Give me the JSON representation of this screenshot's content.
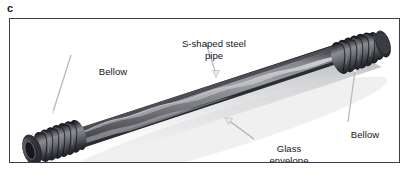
{
  "figure": {
    "panel_letter": "c",
    "type": "technical-illustration",
    "background_color": "#ffffff",
    "frame_border_color": "#3b3f4d"
  },
  "annotations": [
    {
      "id": "s-shaped-pipe",
      "text": "S-shaped steel\npipe",
      "lines": [
        "S-shaped steel",
        "pipe"
      ],
      "pointer": "arrow-down-right"
    },
    {
      "id": "bellow-left",
      "text": "Bellow",
      "lines": [
        "Bellow"
      ],
      "pointer": "line-down-left"
    },
    {
      "id": "bellow-right",
      "text": "Bellow",
      "lines": [
        "Bellow"
      ],
      "pointer": "line-up-left"
    },
    {
      "id": "glass-envelope",
      "text": "Glass\nenvelope",
      "lines": [
        "Glass",
        "envelope"
      ],
      "pointer": "arrow-up-left"
    }
  ],
  "illustration": {
    "components": [
      {
        "name": "glass-envelope-tube",
        "color": "#7d7f84"
      },
      {
        "name": "s-shaped-steel-pipe",
        "color": "#b9bbc0"
      },
      {
        "name": "left-bellow",
        "color": "#55585f"
      },
      {
        "name": "right-bellow",
        "color": "#55585f"
      },
      {
        "name": "tube-end-opening",
        "color": "#2a2c31"
      },
      {
        "name": "drop-shadow",
        "color": "#c8cacd"
      }
    ],
    "tube_top_edge_color": "#1c1d21",
    "tube_body_color": "#82848a",
    "tube_highlight_color": "#a9abb0",
    "tube_bottom_shade_color": "#3c3e44"
  },
  "colors": {
    "text": "#14151a",
    "leader_line": "#8e9096",
    "frame": "#3b3f4d",
    "page_background": "#ffffff"
  }
}
